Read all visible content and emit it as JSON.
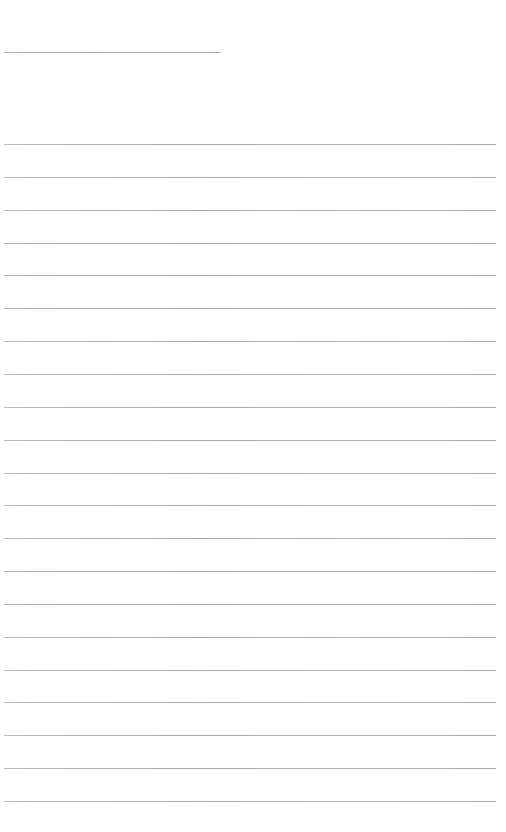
{
  "page": {
    "type": "lined-paper",
    "background_color": "#ffffff",
    "rule_color": "#aaaaaa",
    "header_rule": {
      "top": 52,
      "left": 4,
      "width": 217,
      "text": ""
    },
    "full_rules": {
      "count": 21,
      "first_top": 144,
      "spacing": 32.85,
      "left": 4,
      "width": 492
    },
    "lines": [
      "",
      "",
      "",
      "",
      "",
      "",
      "",
      "",
      "",
      "",
      "",
      "",
      "",
      "",
      "",
      "",
      "",
      "",
      "",
      "",
      ""
    ]
  }
}
